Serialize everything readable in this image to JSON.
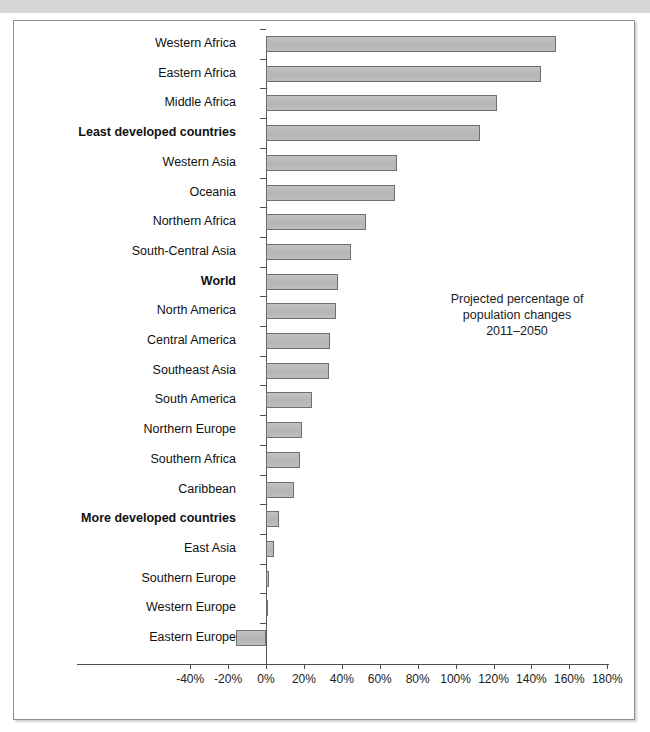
{
  "page": {
    "top_band_ghost_text": ""
  },
  "annotation": {
    "line1": "Projected percentage of",
    "line2": "population changes",
    "line3": "2011–2050"
  },
  "chart_data": {
    "type": "bar",
    "orientation": "horizontal",
    "title": "",
    "subtitle": "",
    "annotation": "Projected percentage of population changes 2011–2050",
    "xlabel": "",
    "ylabel": "",
    "xlim": [
      -40,
      180
    ],
    "xtick_labels": [
      "-40%",
      "-20%",
      "0%",
      "20%",
      "40%",
      "60%",
      "80%",
      "100%",
      "120%",
      "140%",
      "160%",
      "180%"
    ],
    "xticks": [
      -40,
      -20,
      0,
      20,
      40,
      60,
      80,
      100,
      120,
      140,
      160,
      180
    ],
    "grid": false,
    "legend": null,
    "value_unit": "%",
    "bar_fill_color": "#b9b9b9",
    "bar_border_color": "#6e6e6e",
    "categories": [
      "Western Africa",
      "Eastern Africa",
      "Middle Africa",
      "Least developed countries",
      "Western Asia",
      "Oceania",
      "Northern Africa",
      "South-Central Asia",
      "World",
      "North America",
      "Central America",
      "Southeast Asia",
      "South America",
      "Northern Europe",
      "Southern Africa",
      "Caribbean",
      "More developed countries",
      "East Asia",
      "Southern Europe",
      "Western Europe",
      "Eastern Europe"
    ],
    "values": [
      153,
      145,
      122,
      113,
      69,
      68,
      53,
      45,
      38,
      37,
      34,
      33,
      24,
      19,
      18,
      15,
      7,
      4,
      1.5,
      1,
      -16
    ],
    "bold_categories": [
      "Least developed countries",
      "World",
      "More developed countries"
    ]
  }
}
